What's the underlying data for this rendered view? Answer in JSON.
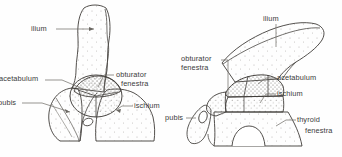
{
  "figure": {
    "type": "anatomical-line-diagram",
    "background_color": "#fefefe",
    "ink_color": "#3a3a3a",
    "stipple_color": "#9a9a9a",
    "panels": [
      {
        "id": "left-pelvis",
        "name": "left-pelvis-diagram",
        "labels": [
          {
            "id": "ilium",
            "text": "ilium",
            "x": 31,
            "y": 25,
            "clipped": false
          },
          {
            "id": "acetabulum",
            "text": "acetabulum",
            "x": -1,
            "y": 75,
            "clipped": true
          },
          {
            "id": "obturator-line1",
            "text": "obturator",
            "x": 116,
            "y": 71,
            "clipped": false
          },
          {
            "id": "obturator-line2",
            "text": "fenestra",
            "x": 121,
            "y": 80,
            "clipped": false
          },
          {
            "id": "pubis",
            "text": "pubis",
            "x": -2,
            "y": 99,
            "clipped": true
          },
          {
            "id": "ischium",
            "text": "ischium",
            "x": 134,
            "y": 102,
            "clipped": false
          }
        ]
      },
      {
        "id": "right-pelvis",
        "name": "right-pelvis-diagram",
        "labels": [
          {
            "id": "ilium",
            "text": "ilium",
            "x": 263,
            "y": 15,
            "clipped": false
          },
          {
            "id": "obturator-line1",
            "text": "obturator",
            "x": 181,
            "y": 55,
            "clipped": false
          },
          {
            "id": "obturator-line2",
            "text": "fenestra",
            "x": 181,
            "y": 64,
            "clipped": false
          },
          {
            "id": "acetabulum",
            "text": "acetabulum",
            "x": 277,
            "y": 74,
            "clipped": false
          },
          {
            "id": "ischium",
            "text": "ischium",
            "x": 277,
            "y": 90,
            "clipped": false
          },
          {
            "id": "pubis",
            "text": "pubis",
            "x": 165,
            "y": 114,
            "clipped": false
          },
          {
            "id": "thyroid-line1",
            "text": "thyroid",
            "x": 297,
            "y": 116,
            "clipped": false
          },
          {
            "id": "thyroid-line2",
            "text": "fenestra",
            "x": 305,
            "y": 127,
            "clipped": false
          }
        ]
      }
    ]
  }
}
